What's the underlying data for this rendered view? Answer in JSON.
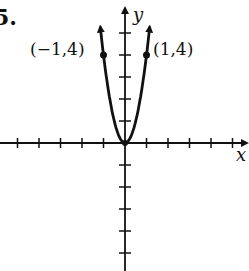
{
  "problem": {
    "number": "5."
  },
  "chart_data": {
    "type": "line",
    "title": "",
    "function": "y = 4x^2",
    "xlabel": "x",
    "ylabel": "y",
    "xlim": [
      -5.8,
      5.6
    ],
    "ylim": [
      -5.8,
      5.5
    ],
    "grid": false,
    "x_ticks": [
      -5,
      -4,
      -3,
      -2,
      -1,
      1,
      2,
      3,
      4,
      5
    ],
    "y_ticks": [
      -5,
      -4,
      -3,
      -2,
      -1,
      1,
      2,
      3,
      4,
      5
    ],
    "tick_labels_shown": false,
    "series": [
      {
        "name": "parabola",
        "x": [
          -1.15,
          -1,
          -0.75,
          -0.5,
          -0.25,
          0,
          0.25,
          0.5,
          0.75,
          1,
          1.15
        ],
        "y": [
          5.29,
          4,
          2.25,
          1,
          0.25,
          0,
          0.25,
          1,
          2.25,
          4,
          5.29
        ],
        "arrows_at_ends": true
      }
    ],
    "annotations": [
      {
        "text": "(−1,4)",
        "x": -1,
        "y": 4,
        "marked_point": true
      },
      {
        "text": "(1,4)",
        "x": 1,
        "y": 4,
        "marked_point": true
      }
    ],
    "points": [
      {
        "label": "(−1,4)",
        "x": -1,
        "y": 4
      },
      {
        "label": "(1,4)",
        "x": 1,
        "y": 4
      }
    ]
  },
  "labels": {
    "x_axis": "x",
    "y_axis": "y",
    "left_point": "(−1,4)",
    "right_point": "(1,4)"
  }
}
